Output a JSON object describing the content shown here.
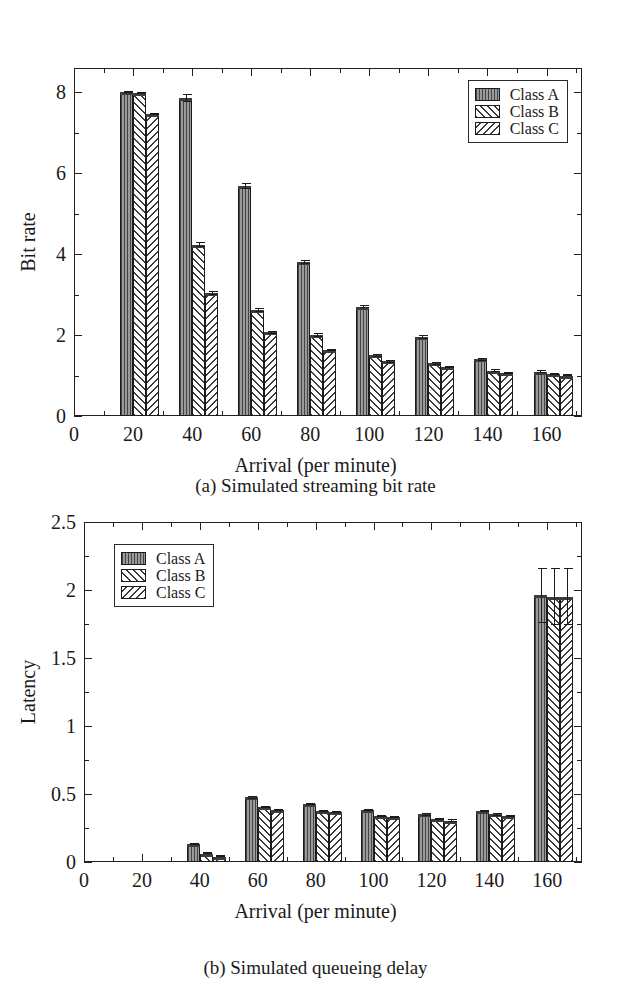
{
  "figure": {
    "panels": [
      {
        "id": "a",
        "caption": "(a)  Simulated streaming bit rate",
        "legend": {
          "items": [
            {
              "label": "Class A",
              "pattern": "vertical-lines"
            },
            {
              "label": "Class B",
              "pattern": "forward-diagonal-hatch"
            },
            {
              "label": "Class C",
              "pattern": "backward-diagonal-hatch"
            }
          ]
        }
      },
      {
        "id": "b",
        "caption": "(b)  Simulated queueing delay",
        "legend": {
          "items": [
            {
              "label": "Class A",
              "pattern": "vertical-lines"
            },
            {
              "label": "Class B",
              "pattern": "forward-diagonal-hatch"
            },
            {
              "label": "Class C",
              "pattern": "backward-diagonal-hatch"
            }
          ]
        }
      }
    ]
  },
  "chart_data": [
    {
      "type": "bar",
      "title": "(a)  Simulated streaming bit rate",
      "xlabel": "Arrival (per minute)",
      "ylabel": "Bit rate",
      "xlim": [
        0,
        172
      ],
      "ylim": [
        0,
        8.6
      ],
      "xticks": [
        0,
        20,
        40,
        60,
        80,
        100,
        120,
        140,
        160
      ],
      "xtick_labels": [
        "0",
        "20",
        "40",
        "60",
        "80",
        "100",
        "120",
        "140",
        "160"
      ],
      "xminor": [
        10,
        30,
        50,
        70,
        90,
        110,
        130,
        150,
        170
      ],
      "yticks": [
        0,
        2,
        4,
        6,
        8
      ],
      "ytick_labels": [
        "0",
        "2",
        "4",
        "6",
        "8"
      ],
      "yminor": [
        1,
        3,
        5,
        7
      ],
      "grid": false,
      "legend_position": "top-right",
      "categories": [
        20,
        40,
        60,
        80,
        100,
        120,
        140,
        160
      ],
      "series": [
        {
          "name": "Class A",
          "values": [
            8.0,
            7.87,
            5.68,
            3.8,
            2.7,
            1.95,
            1.4,
            1.1
          ],
          "errors": [
            0.02,
            0.1,
            0.08,
            0.05,
            0.04,
            0.04,
            0.03,
            0.03
          ]
        },
        {
          "name": "Class B",
          "values": [
            7.98,
            4.23,
            2.62,
            2.0,
            1.5,
            1.3,
            1.12,
            1.03
          ],
          "errors": [
            0.03,
            0.06,
            0.05,
            0.04,
            0.03,
            0.03,
            0.03,
            0.02
          ]
        },
        {
          "name": "Class C",
          "values": [
            7.47,
            3.05,
            2.07,
            1.63,
            1.35,
            1.2,
            1.07,
            1.0
          ],
          "errors": [
            0.03,
            0.05,
            0.04,
            0.03,
            0.03,
            0.02,
            0.02,
            0.02
          ]
        }
      ]
    },
    {
      "type": "bar",
      "title": "(b)  Simulated queueing delay",
      "xlabel": "Arrival (per minute)",
      "ylabel": "Latency",
      "xlim": [
        0,
        172
      ],
      "ylim": [
        0,
        2.5
      ],
      "xticks": [
        0,
        20,
        40,
        60,
        80,
        100,
        120,
        140,
        160
      ],
      "xtick_labels": [
        "0",
        "20",
        "40",
        "60",
        "80",
        "100",
        "120",
        "140",
        "160"
      ],
      "xminor": [
        10,
        30,
        50,
        70,
        90,
        110,
        130,
        150,
        170
      ],
      "yticks": [
        0,
        0.5,
        1,
        1.5,
        2,
        2.5
      ],
      "ytick_labels": [
        "0",
        "0.5",
        "1",
        "1.5",
        "2",
        "2.5"
      ],
      "yminor": [
        0.25,
        0.75,
        1.25,
        1.75,
        2.25
      ],
      "grid": false,
      "legend_position": "top-left",
      "categories": [
        20,
        40,
        60,
        80,
        100,
        120,
        140,
        160
      ],
      "series": [
        {
          "name": "Class A",
          "values": [
            0.0,
            0.13,
            0.475,
            0.425,
            0.385,
            0.35,
            0.375,
            1.96
          ],
          "errors": [
            0.0,
            0.005,
            0.01,
            0.008,
            0.008,
            0.008,
            0.008,
            0.2
          ]
        },
        {
          "name": "Class B",
          "values": [
            0.0,
            0.06,
            0.405,
            0.375,
            0.34,
            0.315,
            0.35,
            1.95
          ],
          "errors": [
            0.0,
            0.004,
            0.008,
            0.008,
            0.008,
            0.008,
            0.008,
            0.21
          ]
        },
        {
          "name": "Class C",
          "values": [
            0.0,
            0.04,
            0.385,
            0.365,
            0.33,
            0.305,
            0.34,
            1.95
          ],
          "errors": [
            0.0,
            0.004,
            0.008,
            0.008,
            0.008,
            0.008,
            0.008,
            0.21
          ]
        }
      ]
    }
  ]
}
